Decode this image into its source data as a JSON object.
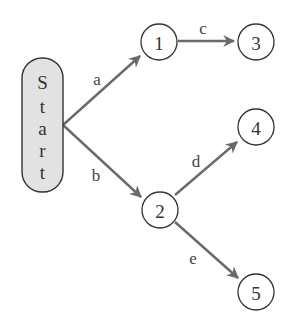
{
  "diagram": {
    "type": "tree",
    "start": {
      "label_chars": [
        "S",
        "t",
        "a",
        "r",
        "t"
      ],
      "fill": "#e2e2e2"
    },
    "nodes": [
      {
        "id": "1",
        "label": "1"
      },
      {
        "id": "2",
        "label": "2"
      },
      {
        "id": "3",
        "label": "3"
      },
      {
        "id": "4",
        "label": "4"
      },
      {
        "id": "5",
        "label": "5"
      }
    ],
    "edges": [
      {
        "from": "Start",
        "to": "1",
        "label": "a"
      },
      {
        "from": "Start",
        "to": "2",
        "label": "b"
      },
      {
        "from": "1",
        "to": "3",
        "label": "c"
      },
      {
        "from": "2",
        "to": "4",
        "label": "d"
      },
      {
        "from": "2",
        "to": "5",
        "label": "e"
      }
    ],
    "edge_color": "#6a6a6a"
  }
}
